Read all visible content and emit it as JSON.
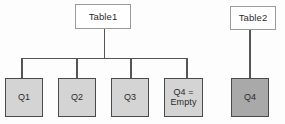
{
  "diagram": {
    "background_color": "#fdfdfd",
    "connector_color": "#555555",
    "parent_fill": "#ffffff",
    "parent_border": "#9a9a9a",
    "child_fill": "#d4d4d4",
    "child_fill_dark": "#a9a9a9",
    "child_border": "#4a4a4a"
  },
  "tree_left": {
    "root": {
      "label": "Table1",
      "name": "table1-node"
    },
    "children": [
      {
        "label": "Q1",
        "name": "q1-node",
        "fill": "light"
      },
      {
        "label": "Q2",
        "name": "q2-node",
        "fill": "light"
      },
      {
        "label": "Q3",
        "name": "q3-node",
        "fill": "light"
      },
      {
        "label": "Q4 =\nEmpty",
        "name": "q4-empty-node",
        "fill": "light"
      }
    ]
  },
  "tree_right": {
    "root": {
      "label": "Table2",
      "name": "table2-node"
    },
    "children": [
      {
        "label": "Q4",
        "name": "q4-node",
        "fill": "dark"
      }
    ]
  }
}
